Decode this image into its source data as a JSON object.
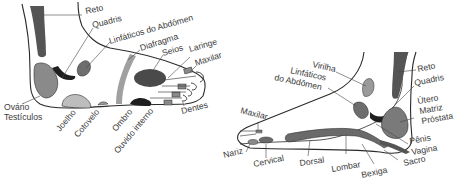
{
  "colors": {
    "outline": "#2a2a2a",
    "dark": "#3d3d3d",
    "darkest": "#1f1f1f",
    "mid": "#7a7a7a",
    "light": "#a9a9a9",
    "lighter": "#c4c4c4",
    "label": "#3a3a3a"
  },
  "left_foot": {
    "labels": {
      "reto": "Reto",
      "quadris": "Quadris",
      "linfaticos": "Linfáticos do Abdômen",
      "diafragma": "Diafragma",
      "seios": "Seios",
      "laringe": "Laringe",
      "maxilar": "Maxilar",
      "ovario": "Ovário",
      "testiculos": "Testículos",
      "joelho": "Joelho",
      "cotovelo": "Cotovelo",
      "ombro": "Ombro",
      "ouvido": "Ouvido interno",
      "dentes": "Dentes"
    }
  },
  "right_foot": {
    "labels": {
      "virilha": "Virilha",
      "linfaticos1": "Linfáticos",
      "linfaticos2": "do Abdômen",
      "reto": "Reto",
      "quadris": "Quadris",
      "utero": "Útero",
      "matriz": "Matriz",
      "prostata": "Próstata",
      "maxilar": "Maxilar",
      "nariz": "Nariz",
      "cervical": "Cervical",
      "dorsal": "Dorsal",
      "lombar": "Lombar",
      "bexiga": "Bexiga",
      "sacro": "Sacro",
      "penis": "Pênis",
      "vagina": "Vagina"
    }
  }
}
